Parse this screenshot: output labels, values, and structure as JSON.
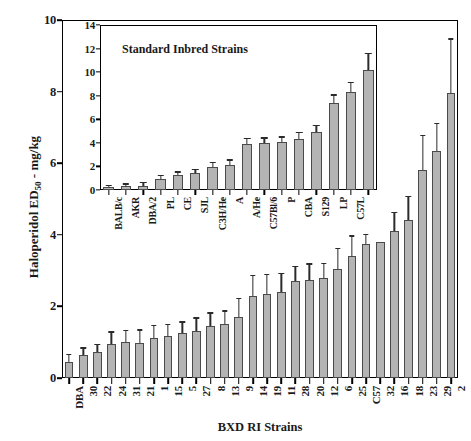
{
  "figure": {
    "background": "#ffffff",
    "bar_fill": "#b4b4b4",
    "bar_stroke": "#4a4a4a",
    "error_color": "#2b2b2b"
  },
  "chart_data": [
    {
      "id": "main",
      "type": "bar",
      "title": "",
      "xlabel": "BXD RI Strains",
      "ylabel": "Haloperidol ED50 - mg/kg",
      "ylabel_prefix": "Haloperidol ED",
      "ylabel_sub": "50",
      "ylabel_suffix": " - mg/kg",
      "ylim": [
        0,
        10
      ],
      "yticks": [
        0,
        2,
        4,
        6,
        8,
        10
      ],
      "ytick_labels": [
        "0",
        "2",
        "4",
        "6",
        "8",
        "10"
      ],
      "grid": false,
      "legend": "none",
      "error_type": "sem",
      "categories": [
        "DBA",
        "30",
        "22",
        "24",
        "31",
        "21",
        "1",
        "15",
        "5",
        "27",
        "8",
        "13",
        "9",
        "14",
        "19",
        "11",
        "28",
        "20",
        "12",
        "6",
        "25",
        "C57",
        "32",
        "16",
        "18",
        "23",
        "29",
        "2"
      ],
      "values": [
        0.45,
        0.65,
        0.72,
        0.95,
        1.0,
        0.98,
        1.12,
        1.18,
        1.25,
        1.3,
        1.45,
        1.5,
        1.7,
        2.3,
        2.35,
        2.4,
        2.7,
        2.75,
        2.8,
        3.05,
        3.4,
        3.75,
        3.8,
        4.1,
        4.4,
        5.8,
        6.35,
        7.95
      ],
      "errors": [
        0.18,
        0.17,
        0.2,
        0.32,
        0.3,
        0.34,
        0.32,
        0.3,
        0.3,
        0.36,
        0.35,
        0.35,
        0.5,
        0.55,
        0.52,
        0.5,
        0.4,
        0.42,
        0.38,
        0.55,
        0.55,
        0.25,
        0.0,
        0.5,
        0.65,
        0.95,
        0.75,
        1.5
      ]
    },
    {
      "id": "inset",
      "type": "bar",
      "title": "Standard Inbred Strains",
      "xlabel": "",
      "ylabel": "",
      "ylim": [
        0,
        14
      ],
      "yticks": [
        0,
        2,
        4,
        6,
        8,
        10,
        12,
        14
      ],
      "ytick_labels": [
        "0",
        "2",
        "4",
        "6",
        "8",
        "10",
        "12",
        "14"
      ],
      "grid": false,
      "legend": "none",
      "error_type": "sem",
      "categories": [
        "BALB/c",
        "AKR",
        "DBA/2",
        "PL",
        "CE",
        "SJL",
        "C3H/He",
        "A",
        "A/He",
        "C57Bl/6",
        "P",
        "CBA",
        "S129",
        "LP",
        "C57L"
      ],
      "values": [
        0.22,
        0.3,
        0.38,
        0.9,
        1.25,
        1.45,
        1.95,
        2.1,
        3.9,
        4.0,
        4.1,
        4.35,
        4.9,
        7.35,
        8.3,
        10.2
      ],
      "errors": [
        0.12,
        0.15,
        0.18,
        0.3,
        0.22,
        0.25,
        0.35,
        0.38,
        0.4,
        0.35,
        0.35,
        0.45,
        0.5,
        0.65,
        0.75,
        1.3
      ]
    }
  ],
  "main": {
    "x_title": "BXD RI Strains",
    "y_title_prefix": "Haloperidol ED",
    "y_title_sub": "50",
    "y_title_suffix": " - mg/kg"
  },
  "inset": {
    "title": "Standard Inbred Strains"
  }
}
